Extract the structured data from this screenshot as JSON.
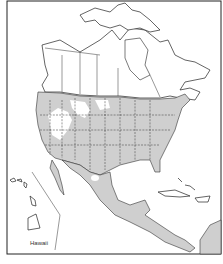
{
  "map": {
    "title": "",
    "inset_label": "Hawaii",
    "legend": {
      "range_fill": "#cfcfcf",
      "range_meaning": "species range"
    },
    "shaded_regions": [
      "United States (except interior West gaps)",
      "Mexico",
      "Central America"
    ],
    "colors": {
      "range": "#cfcfcf",
      "land": "#ffffff",
      "outline": "#222222"
    }
  }
}
